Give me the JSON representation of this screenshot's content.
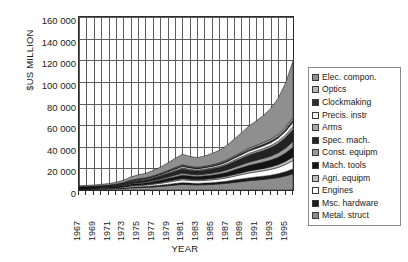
{
  "chart_data": {
    "type": "area",
    "title": "",
    "subtitle": "",
    "xlabel": "YEAR",
    "ylabel": "$US MILLION",
    "ylim": [
      0,
      160000
    ],
    "xlim": [
      1967,
      1996
    ],
    "grid": true,
    "legend_position": "right",
    "stacked": true,
    "ytick_labels": [
      "160 000",
      "140 000",
      "120 000",
      "100 000",
      "80 000",
      "60 000",
      "40 000",
      "20 000",
      "0"
    ],
    "ytick_values": [
      160000,
      140000,
      120000,
      100000,
      80000,
      60000,
      40000,
      20000,
      0
    ],
    "xtick_labels": [
      "1967",
      "1969",
      "1971",
      "1973",
      "1975",
      "1977",
      "1979",
      "1981",
      "1983",
      "1985",
      "1987",
      "1989",
      "1991",
      "1993",
      "1995"
    ],
    "xtick_values": [
      1967,
      1969,
      1971,
      1973,
      1975,
      1977,
      1979,
      1981,
      1983,
      1985,
      1987,
      1989,
      1991,
      1993,
      1995
    ],
    "x": [
      1967,
      1968,
      1969,
      1970,
      1971,
      1972,
      1973,
      1974,
      1975,
      1976,
      1977,
      1978,
      1979,
      1980,
      1981,
      1982,
      1983,
      1984,
      1985,
      1986,
      1987,
      1988,
      1989,
      1990,
      1991,
      1992,
      1993,
      1994,
      1995,
      1996
    ],
    "series": [
      {
        "name": "Metal. struct",
        "color": "#8c8c8c",
        "values": [
          700,
          750,
          800,
          900,
          1000,
          1200,
          1500,
          2000,
          2300,
          2500,
          2900,
          3400,
          4000,
          4600,
          5200,
          4900,
          4700,
          4900,
          5200,
          5600,
          6200,
          7000,
          7800,
          8600,
          9200,
          9800,
          10500,
          11500,
          13000,
          15000
        ]
      },
      {
        "name": "Msc. hardware",
        "color": "#1c1c1c",
        "values": [
          200,
          220,
          240,
          270,
          300,
          360,
          450,
          600,
          700,
          760,
          880,
          1030,
          1210,
          1390,
          1570,
          1480,
          1420,
          1480,
          1570,
          1690,
          1870,
          2110,
          2350,
          2600,
          2780,
          2960,
          3170,
          3470,
          3920,
          4530
        ]
      },
      {
        "name": "Engines",
        "color": "#fbfbfb",
        "values": [
          350,
          380,
          410,
          460,
          520,
          620,
          780,
          1040,
          1200,
          1300,
          1510,
          1770,
          2080,
          2390,
          2700,
          2550,
          2440,
          2550,
          2700,
          2910,
          3220,
          3640,
          4050,
          4470,
          4780,
          5090,
          5450,
          5970,
          6750,
          7790
        ]
      },
      {
        "name": "Agri. equipm",
        "color": "#bdbdbd",
        "values": [
          150,
          160,
          175,
          195,
          220,
          265,
          330,
          440,
          510,
          550,
          640,
          750,
          880,
          1010,
          1145,
          1080,
          1035,
          1080,
          1145,
          1235,
          1365,
          1540,
          1715,
          1895,
          2025,
          2160,
          2310,
          2530,
          2860,
          3300
        ]
      },
      {
        "name": "Mach. tools",
        "color": "#141414",
        "values": [
          400,
          430,
          470,
          530,
          590,
          710,
          890,
          1180,
          1370,
          1480,
          1720,
          2010,
          2360,
          2720,
          3070,
          2900,
          2770,
          2900,
          3070,
          3310,
          3660,
          4140,
          4600,
          5080,
          5430,
          5790,
          6190,
          6780,
          7670,
          8860
        ]
      },
      {
        "name": "Const. equipm",
        "color": "#9a9a9a",
        "values": [
          250,
          270,
          290,
          330,
          370,
          440,
          550,
          740,
          850,
          920,
          1070,
          1250,
          1470,
          1690,
          1910,
          1800,
          1720,
          1800,
          1910,
          2060,
          2280,
          2570,
          2860,
          3160,
          3380,
          3600,
          3850,
          4220,
          4770,
          5510
        ]
      },
      {
        "name": "Spec. mach.",
        "color": "#232323",
        "values": [
          500,
          540,
          590,
          660,
          740,
          890,
          1110,
          1480,
          1710,
          1850,
          2150,
          2510,
          2950,
          3400,
          3840,
          3620,
          3460,
          3620,
          3840,
          4140,
          4570,
          5170,
          5750,
          6350,
          6790,
          7240,
          7740,
          8480,
          9590,
          11070
        ]
      },
      {
        "name": "Arms",
        "color": "#a8a8a8",
        "values": [
          120,
          130,
          140,
          160,
          180,
          215,
          270,
          360,
          415,
          450,
          520,
          610,
          715,
          825,
          930,
          880,
          840,
          880,
          930,
          1005,
          1110,
          1255,
          1395,
          1540,
          1650,
          1760,
          1880,
          2060,
          2330,
          2690
        ]
      },
      {
        "name": "Precis. instr",
        "color": "#f2f2f2",
        "values": [
          180,
          195,
          210,
          235,
          265,
          320,
          400,
          530,
          615,
          665,
          770,
          900,
          1060,
          1220,
          1380,
          1300,
          1240,
          1300,
          1380,
          1490,
          1645,
          1860,
          2070,
          2285,
          2445,
          2605,
          2785,
          3050,
          3450,
          3985
        ]
      },
      {
        "name": "Clockmaking",
        "color": "#2e2e2e",
        "values": [
          90,
          97,
          105,
          118,
          133,
          160,
          200,
          265,
          307,
          333,
          385,
          450,
          530,
          610,
          690,
          650,
          620,
          650,
          690,
          745,
          822,
          930,
          1035,
          1142,
          1222,
          1302,
          1392,
          1525,
          1725,
          1992
        ]
      },
      {
        "name": "Optics",
        "color": "#b5b5b5",
        "values": [
          110,
          119,
          129,
          145,
          163,
          196,
          245,
          325,
          376,
          408,
          472,
          552,
          650,
          748,
          846,
          797,
          760,
          797,
          846,
          913,
          1008,
          1140,
          1269,
          1400,
          1498,
          1596,
          1706,
          1869,
          2114,
          2441
        ]
      },
      {
        "name": "Elec. compon.",
        "color": "#8f8f8f",
        "values": [
          900,
          980,
          1080,
          1230,
          1420,
          1750,
          2250,
          3100,
          3700,
          4100,
          4900,
          5900,
          7100,
          8400,
          9800,
          9200,
          8900,
          9500,
          10400,
          11600,
          13300,
          15600,
          17900,
          20400,
          22600,
          25200,
          28500,
          33500,
          41000,
          52000
        ]
      }
    ]
  },
  "legend": {
    "items": [
      {
        "label": "Elec. compon.",
        "swatch": "#8f8f8f"
      },
      {
        "label": "Optics",
        "swatch": "#b5b5b5"
      },
      {
        "label": "Clockmaking",
        "swatch": "#2e2e2e"
      },
      {
        "label": "Precis. instr",
        "swatch": "#f2f2f2"
      },
      {
        "label": "Arms",
        "swatch": "#a8a8a8"
      },
      {
        "label": "Spec. mach.",
        "swatch": "#232323"
      },
      {
        "label": "Const. equipm",
        "swatch": "#9a9a9a"
      },
      {
        "label": "Mach. tools",
        "swatch": "#141414"
      },
      {
        "label": "Agri. equipm",
        "swatch": "#bdbdbd"
      },
      {
        "label": "Engines",
        "swatch": "#fbfbfb"
      },
      {
        "label": "Msc. hardware",
        "swatch": "#1c1c1c"
      },
      {
        "label": "Metal. struct",
        "swatch": "#8c8c8c"
      }
    ]
  }
}
